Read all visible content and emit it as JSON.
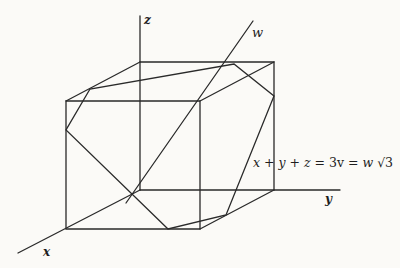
{
  "figure": {
    "axes": {
      "x": "x",
      "y": "y",
      "z": "z",
      "w": "w"
    },
    "equation": {
      "lhs": "x + y + z",
      "mid": "3v",
      "rhs_var": "w",
      "rhs_root": "√3",
      "full": "x + y + z = 3v = w √3"
    },
    "colors": {
      "background": "#fbfaf7",
      "ink": "#2a2a2a"
    },
    "geometry": {
      "origin": [
        140,
        190
      ],
      "back_face": [
        [
          140,
          62
        ],
        [
          274,
          62
        ],
        [
          274,
          190
        ],
        [
          140,
          190
        ]
      ],
      "front_face": [
        [
          66,
          101
        ],
        [
          200,
          101
        ],
        [
          200,
          229
        ],
        [
          66,
          229
        ]
      ],
      "hexagon": [
        [
          90,
          89
        ],
        [
          66,
          130
        ],
        [
          168,
          229
        ],
        [
          226,
          215
        ],
        [
          274,
          96
        ],
        [
          234,
          64
        ]
      ]
    }
  }
}
